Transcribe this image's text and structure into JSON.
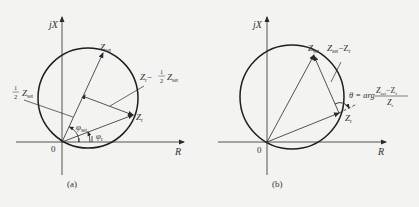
{
  "panels": [
    {
      "id": "a",
      "caption": "(a)",
      "axis_x_label": "R",
      "axis_y_label": "jX",
      "origin_label": "0",
      "vectors": {
        "z_set": "Z",
        "z_set_sub": "set",
        "z_r": "Z",
        "z_r_sub": "r",
        "half_z_set_frac": "1/2",
        "half_z_set": "Z",
        "half_z_set_sub": "set",
        "diff_prefix": "Z",
        "diff_prefix_sub": "r",
        "diff_minus": "−",
        "diff_frac_num": "1",
        "diff_frac_den": "2",
        "diff_z": "Z",
        "diff_z_sub": "set"
      },
      "angles": {
        "phi_set": "φ",
        "phi_set_sub": "set",
        "phi_r": "φ",
        "phi_r_sub": "r"
      }
    },
    {
      "id": "b",
      "caption": "(b)",
      "axis_x_label": "R",
      "axis_y_label": "jX",
      "origin_label": "0",
      "vectors": {
        "z_set": "Z",
        "z_set_sub": "set",
        "z_r": "Z",
        "z_r_sub": "r",
        "diff": "Z",
        "diff_sub": "set",
        "diff_minus": "−Z",
        "diff_minus_sub": "r"
      },
      "theta": {
        "lhs": "θ = arg",
        "num": "Z",
        "num_sub": "set",
        "num_rest": "−Z",
        "num_rest_sub": "r",
        "den": "Z",
        "den_sub": "r"
      }
    }
  ],
  "colors": {
    "background": "#f3f3f1",
    "ink": "#2a2a2a",
    "circle": "#1e1e1e"
  }
}
